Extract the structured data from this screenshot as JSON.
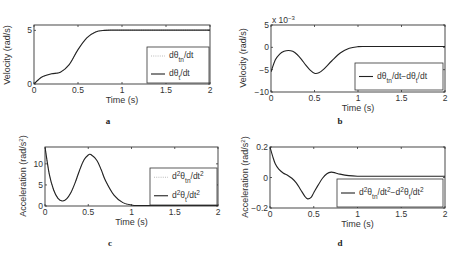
{
  "chart_data": [
    {
      "id": "a",
      "type": "line",
      "panel_label": "a",
      "xlabel": "Time (s)",
      "ylabel": "Velocity (rad/s)",
      "xlim": [
        0,
        2
      ],
      "ylim": [
        0,
        5.5
      ],
      "xticks": [
        "0",
        "0.5",
        "1",
        "1.5",
        "2"
      ],
      "yticks": [
        "0",
        "5"
      ],
      "ytick_values": [
        0,
        5
      ],
      "grid": false,
      "legend_position": "lower right",
      "series": [
        {
          "name": "dθtn/dt",
          "legend_main": "dθ",
          "legend_sub": "tn",
          "legend_tail": "/dt",
          "style": "dotted",
          "x": [
            0,
            0.05,
            0.1,
            0.2,
            0.3,
            0.4,
            0.5,
            0.6,
            0.7,
            0.8,
            0.9,
            1.0,
            1.5,
            2.0
          ],
          "y": [
            0,
            0.4,
            0.7,
            0.95,
            1.1,
            1.8,
            3.2,
            4.3,
            4.85,
            5.0,
            5.02,
            5.02,
            5.02,
            5.02
          ]
        },
        {
          "name": "dθt/dt",
          "legend_main": "dθ",
          "legend_sub": "t",
          "legend_tail": "/dt",
          "style": "solid",
          "x": [
            0,
            0.05,
            0.1,
            0.2,
            0.3,
            0.4,
            0.5,
            0.6,
            0.7,
            0.8,
            0.9,
            1.0,
            1.5,
            2.0
          ],
          "y": [
            0,
            0.4,
            0.7,
            0.95,
            1.1,
            1.8,
            3.2,
            4.3,
            4.85,
            5.0,
            5.02,
            5.02,
            5.02,
            5.02
          ]
        }
      ]
    },
    {
      "id": "b",
      "type": "line",
      "panel_label": "b",
      "xlabel": "Time (s)",
      "ylabel": "Velocity (rad/s)",
      "y_multiplier": "x 10",
      "y_multiplier_exp": "-3",
      "xlim": [
        0,
        2
      ],
      "ylim": [
        -10,
        5
      ],
      "xticks": [
        "0",
        "0.5",
        "1",
        "1.5",
        "2"
      ],
      "yticks": [
        "-10",
        "-5",
        "0",
        "5"
      ],
      "ytick_values": [
        -10,
        -5,
        0,
        5
      ],
      "grid": false,
      "legend_position": "lower right",
      "series": [
        {
          "name": "dθtn/dt-dθt/dt",
          "style": "solid",
          "x": [
            0,
            0.05,
            0.1,
            0.15,
            0.2,
            0.25,
            0.3,
            0.35,
            0.4,
            0.45,
            0.5,
            0.55,
            0.6,
            0.7,
            0.8,
            0.9,
            1.0,
            1.1,
            1.5,
            2.0
          ],
          "y": [
            -5.5,
            -2.8,
            -1.5,
            -0.9,
            -0.7,
            -0.9,
            -1.6,
            -2.7,
            -4.0,
            -5.1,
            -5.8,
            -5.7,
            -5.0,
            -3.0,
            -1.2,
            -0.2,
            0.15,
            0.2,
            0.2,
            0.2
          ]
        }
      ]
    },
    {
      "id": "c",
      "type": "line",
      "panel_label": "c",
      "xlabel": "Time (s)",
      "ylabel": "Acceleration (rad/s²)",
      "xlim": [
        0,
        2
      ],
      "ylim": [
        0,
        14
      ],
      "xticks": [
        "0",
        "0.5",
        "1",
        "1.5",
        "2"
      ],
      "yticks": [
        "0",
        "5",
        "10"
      ],
      "ytick_values": [
        0,
        5,
        10
      ],
      "grid": false,
      "legend_position": "lower right",
      "series": [
        {
          "name": "d²θtn/dt²",
          "style": "dotted",
          "x": [
            0,
            0.05,
            0.1,
            0.15,
            0.2,
            0.25,
            0.3,
            0.35,
            0.4,
            0.45,
            0.5,
            0.53,
            0.6,
            0.65,
            0.7,
            0.8,
            0.9,
            1.0,
            1.1,
            1.5,
            2.0
          ],
          "y": [
            14,
            7.5,
            3.8,
            1.8,
            1.2,
            1.7,
            3.2,
            5.6,
            8.5,
            10.9,
            12.1,
            12.2,
            10.8,
            8.6,
            6.0,
            2.5,
            0.8,
            0.25,
            0.1,
            0.1,
            0.1
          ]
        },
        {
          "name": "d²θt/dt²",
          "style": "solid",
          "x": [
            0,
            0.05,
            0.1,
            0.15,
            0.2,
            0.25,
            0.3,
            0.35,
            0.4,
            0.45,
            0.5,
            0.53,
            0.6,
            0.65,
            0.7,
            0.8,
            0.9,
            1.0,
            1.1,
            1.5,
            2.0
          ],
          "y": [
            14,
            7.5,
            3.8,
            1.8,
            1.2,
            1.7,
            3.2,
            5.6,
            8.5,
            10.9,
            12.1,
            12.2,
            10.8,
            8.6,
            6.0,
            2.5,
            0.8,
            0.25,
            0.1,
            0.1,
            0.1
          ]
        }
      ]
    },
    {
      "id": "d",
      "type": "line",
      "panel_label": "d",
      "xlabel": "Time (s)",
      "ylabel": "Acceleration (rad/s²)",
      "xlim": [
        0,
        2
      ],
      "ylim": [
        -0.2,
        0.2
      ],
      "xticks": [
        "0",
        "0.5",
        "1",
        "1.5",
        "2"
      ],
      "yticks": [
        "-0.2",
        "0",
        "0.2"
      ],
      "ytick_values": [
        -0.2,
        0,
        0.2
      ],
      "grid": false,
      "legend_position": "lower right",
      "series": [
        {
          "name": "d²θtn/dt²-d²θt/dt²",
          "style": "solid",
          "x": [
            0,
            0.03,
            0.06,
            0.1,
            0.15,
            0.2,
            0.25,
            0.3,
            0.35,
            0.4,
            0.43,
            0.47,
            0.5,
            0.55,
            0.6,
            0.65,
            0.7,
            0.75,
            0.8,
            0.9,
            1.0,
            1.1,
            1.5,
            2.0
          ],
          "y": [
            0.2,
            0.14,
            0.09,
            0.055,
            0.03,
            0.015,
            -0.005,
            -0.035,
            -0.08,
            -0.125,
            -0.14,
            -0.13,
            -0.1,
            -0.05,
            -0.005,
            0.025,
            0.035,
            0.03,
            0.022,
            0.012,
            0.008,
            0.008,
            0.008,
            0.008
          ]
        }
      ]
    }
  ],
  "labels": {
    "time": "Time (s)",
    "velocity": "Velocity (rad/s)",
    "acceleration": "Acceleration (rad/s²)",
    "panel_a": "a",
    "panel_b": "b",
    "panel_c": "c",
    "panel_d": "d",
    "multiplier_base": "x 10",
    "multiplier_exp": "-3"
  }
}
